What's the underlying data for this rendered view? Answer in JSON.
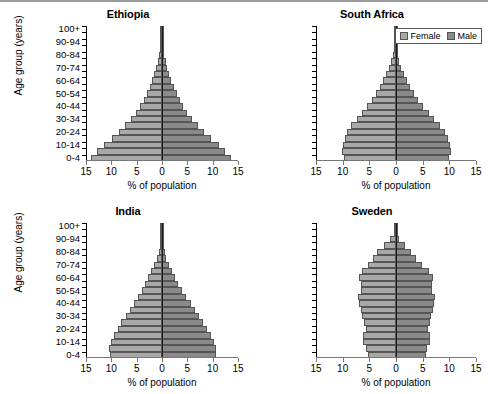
{
  "figure": {
    "xlabel": "% of population",
    "ylabel": "Age group (years)",
    "legend": {
      "female": "Female",
      "male": "Male"
    },
    "colors": {
      "female": "#a8a8a8",
      "male": "#8a8a8a",
      "axis": "#000000"
    }
  },
  "chart_data": {
    "type": "bar",
    "xlabel": "% of population",
    "ylabel": "Age group (years)",
    "xlim": [
      -15,
      15
    ],
    "xticks": [
      15,
      10,
      5,
      0,
      5,
      10,
      15
    ],
    "grid": false,
    "legend": [
      "Female",
      "Male"
    ],
    "legend_position": "top-right of South Africa panel",
    "orientation": "horizontal-diverging",
    "note": "Female plotted to the left of zero, Male to the right; values are % of total population per 5-year age band.",
    "categories": [
      "0-4",
      "5-9",
      "10-14",
      "15-19",
      "20-24",
      "25-29",
      "30-34",
      "35-39",
      "40-44",
      "45-49",
      "50-54",
      "55-59",
      "60-64",
      "65-69",
      "70-74",
      "75-79",
      "80-84",
      "85-89",
      "90-94",
      "95-99",
      "100+"
    ],
    "ytick_labels": [
      "0-4",
      "10-14",
      "20-24",
      "30-34",
      "40-44",
      "50-54",
      "60-64",
      "70-74",
      "80-84",
      "90-94",
      "100+"
    ],
    "panels": [
      {
        "title": "Ethiopia",
        "xticks": [
          15,
          10,
          5,
          0,
          5,
          10,
          15
        ],
        "series": [
          {
            "name": "Female",
            "values": [
              14.0,
              12.8,
              11.4,
              9.9,
              8.5,
              7.3,
              6.2,
              5.2,
              4.4,
              3.6,
              3.0,
              2.4,
              1.9,
              1.5,
              1.1,
              0.8,
              0.5,
              0.3,
              0.15,
              0.06,
              0.02
            ]
          },
          {
            "name": "Male",
            "values": [
              13.6,
              12.5,
              11.2,
              9.7,
              8.3,
              7.1,
              6.0,
              5.0,
              4.2,
              3.5,
              2.9,
              2.3,
              1.8,
              1.4,
              1.0,
              0.7,
              0.45,
              0.25,
              0.12,
              0.05,
              0.02
            ]
          }
        ]
      },
      {
        "title": "South Africa",
        "xticks": [
          15,
          10,
          5,
          0,
          5,
          10,
          15
        ],
        "series": [
          {
            "name": "Female",
            "values": [
              9.8,
              10.2,
              10.0,
              9.6,
              9.2,
              8.4,
              7.4,
              6.4,
              5.4,
              4.5,
              3.7,
              3.0,
              2.4,
              1.8,
              1.3,
              0.9,
              0.55,
              0.3,
              0.14,
              0.05,
              0.02
            ]
          },
          {
            "name": "Male",
            "values": [
              10.0,
              10.3,
              10.1,
              9.7,
              9.1,
              8.2,
              7.1,
              6.1,
              5.1,
              4.2,
              3.4,
              2.7,
              2.1,
              1.5,
              1.0,
              0.65,
              0.38,
              0.2,
              0.09,
              0.03,
              0.01
            ]
          }
        ]
      },
      {
        "title": "India",
        "xticks": [
          15,
          10,
          5,
          0,
          5,
          10,
          15
        ],
        "series": [
          {
            "name": "Female",
            "values": [
              10.2,
              10.4,
              10.0,
              9.4,
              8.7,
              8.0,
              7.2,
              6.4,
              5.6,
              4.8,
              4.0,
              3.3,
              2.7,
              2.1,
              1.5,
              1.0,
              0.6,
              0.32,
              0.15,
              0.05,
              0.02
            ]
          },
          {
            "name": "Male",
            "values": [
              10.6,
              10.7,
              10.3,
              9.6,
              8.9,
              8.1,
              7.3,
              6.5,
              5.7,
              4.8,
              3.9,
              3.2,
              2.5,
              1.9,
              1.3,
              0.85,
              0.5,
              0.25,
              0.11,
              0.04,
              0.01
            ]
          }
        ]
      },
      {
        "title": "Sweden",
        "xticks": [
          15,
          10,
          5,
          0,
          5,
          10,
          15
        ],
        "series": [
          {
            "name": "Female",
            "values": [
              5.3,
              5.6,
              6.1,
              6.1,
              5.7,
              6.0,
              6.3,
              6.6,
              7.0,
              7.2,
              6.6,
              6.6,
              7.0,
              6.4,
              5.2,
              4.4,
              3.6,
              2.3,
              1.1,
              0.35,
              0.06
            ]
          },
          {
            "name": "Male",
            "values": [
              5.6,
              5.9,
              6.4,
              6.4,
              6.0,
              6.3,
              6.6,
              6.9,
              7.2,
              7.4,
              6.8,
              6.7,
              7.0,
              6.2,
              4.8,
              3.8,
              2.8,
              1.6,
              0.6,
              0.15,
              0.02
            ]
          }
        ]
      }
    ]
  }
}
